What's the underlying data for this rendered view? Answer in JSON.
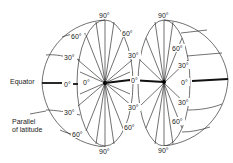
{
  "diagram": {
    "title": "",
    "labels": {
      "equator": "Equator",
      "parallel_line1": "Parallel",
      "parallel_line2": "of latitude"
    },
    "left_hemisphere": {
      "top": "90°",
      "bottom": "90°",
      "outer_north_60": "60°",
      "outer_north_30": "30°",
      "outer_equator": "0°",
      "outer_south_30": "30°",
      "outer_south_60": "60°",
      "disc_equator": "0°",
      "disc_ne_60": "60°",
      "disc_ne_30": "30°",
      "disc_se_30": "30°",
      "disc_se_60": "60°"
    },
    "right_hemisphere": {
      "top": "90°",
      "bottom": "90°",
      "disc_west_equator": "0°",
      "disc_east_equator": "0°",
      "north_60": "60°",
      "north_30": "30°",
      "south_30": "30°",
      "south_60": "60°"
    },
    "colors": {
      "line": "#333333",
      "equator": "#111111",
      "background": "#ffffff"
    }
  }
}
